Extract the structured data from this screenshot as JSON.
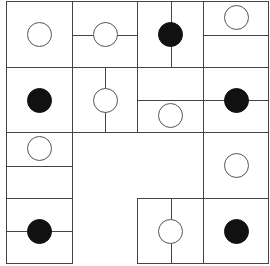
{
  "puzzle": {
    "type": "masyu-style pearl grid",
    "rows": 4,
    "cols": 4,
    "origin": [
      6,
      1
    ],
    "cell_width": 65.5,
    "cell_height": 65.5,
    "colors": {
      "line": "#444444",
      "white_pearl_border": "#555555",
      "black_pearl": "#111111",
      "background": "#ffffff"
    },
    "cells": [
      {
        "r": 0,
        "c": 0,
        "pearl": "white",
        "pearl_pos": "center",
        "lines": []
      },
      {
        "r": 0,
        "c": 1,
        "pearl": "white",
        "pearl_pos": "center",
        "lines": [
          "h-full"
        ]
      },
      {
        "r": 0,
        "c": 2,
        "pearl": "black",
        "pearl_pos": "center",
        "lines": [
          "v-full"
        ]
      },
      {
        "r": 0,
        "c": 3,
        "pearl": "white",
        "pearl_pos": "top",
        "lines": [
          "h-full"
        ]
      },
      {
        "r": 1,
        "c": 0,
        "pearl": "black",
        "pearl_pos": "center",
        "lines": []
      },
      {
        "r": 1,
        "c": 1,
        "pearl": "white",
        "pearl_pos": "center",
        "lines": [
          "v-full"
        ]
      },
      {
        "r": 1,
        "c": 2,
        "pearl": "white",
        "pearl_pos": "bottom",
        "lines": [
          "h-full"
        ]
      },
      {
        "r": 1,
        "c": 3,
        "pearl": "black",
        "pearl_pos": "center",
        "lines": [
          "h-full"
        ]
      },
      {
        "r": 2,
        "c": 0,
        "pearl": "white",
        "pearl_pos": "top",
        "lines": [
          "h-full"
        ]
      },
      {
        "r": 2,
        "c": 1,
        "pearl": "none",
        "empty": true,
        "lines": []
      },
      {
        "r": 2,
        "c": 2,
        "pearl": "none",
        "empty": true,
        "lines": []
      },
      {
        "r": 2,
        "c": 3,
        "pearl": "white",
        "pearl_pos": "center",
        "lines": []
      },
      {
        "r": 3,
        "c": 0,
        "pearl": "black",
        "pearl_pos": "center",
        "lines": [
          "h-full"
        ]
      },
      {
        "r": 3,
        "c": 1,
        "pearl": "none",
        "empty": true,
        "lines": []
      },
      {
        "r": 3,
        "c": 2,
        "pearl": "white",
        "pearl_pos": "center",
        "lines": [
          "v-full"
        ]
      },
      {
        "r": 3,
        "c": 3,
        "pearl": "black",
        "pearl_pos": "center",
        "lines": []
      }
    ]
  }
}
